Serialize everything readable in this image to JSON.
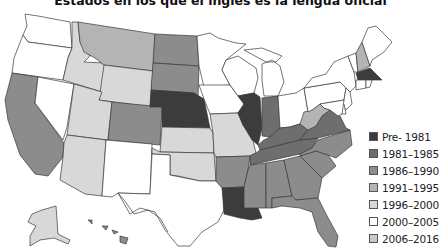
{
  "title": "Estados en los que el inglés es la lengua oficial",
  "legend": [
    {
      "label": "Pre- 1981",
      "color": "#3c3c3c"
    },
    {
      "label": "1981–1985",
      "color": "#6e6e6e"
    },
    {
      "label": "1986–1990",
      "color": "#8c8c8c"
    },
    {
      "label": "1991–1995",
      "color": "#b4b4b4"
    },
    {
      "label": "1996–2000",
      "color": "#d8d8d8"
    },
    {
      "label": "2000–2005",
      "color": "#ffffff"
    },
    {
      "label": "2006–2016",
      "color": "#c8c8c8"
    }
  ],
  "states": {
    "WA": "2000–2005",
    "OR": "2000–2005",
    "CA": "1986–1990",
    "NV": "2000–2005",
    "ID": "1996–2000",
    "MT": "1991–1995",
    "WY": "1996–2000",
    "UT": "1996–2000",
    "AZ": "1996–2000",
    "CO": "1986–1990",
    "NM": "2000–2005",
    "ND": "1986–1990",
    "SD": "1986–1990",
    "NE": "Pre- 1981",
    "KS": "1996–2000",
    "OK": "1996–2000",
    "TX": "2000–2005",
    "MN": "2000–2005",
    "IA": "2000–2005",
    "MO": "1996–2000",
    "AR": "1986–1990",
    "LA": "Pre- 1981",
    "WI": "2000–2005",
    "IL": "Pre- 1981",
    "MI": "2000–2005",
    "IN": "1981–1985",
    "OH": "2000–2005",
    "KY": "1981–1985",
    "TN": "1981–1985",
    "MS": "1986–1990",
    "AL": "1986–1990",
    "GA": "1986–1990",
    "FL": "1986–1990",
    "SC": "1986–1990",
    "NC": "1986–1990",
    "VA": "1981–1985",
    "WV": "1991–1995",
    "PA": "2000–2005",
    "NY": "2000–2005",
    "VT": "2000–2005",
    "NH": "1991–1995",
    "ME": "2000–2005",
    "MA": "Pre- 1981",
    "CT": "2000–2005",
    "RI": "2000–2005",
    "NJ": "2000–2005",
    "DE": "2000–2005",
    "MD": "2000–2005",
    "AK": "1996–2000",
    "HI": "1986–1990"
  }
}
